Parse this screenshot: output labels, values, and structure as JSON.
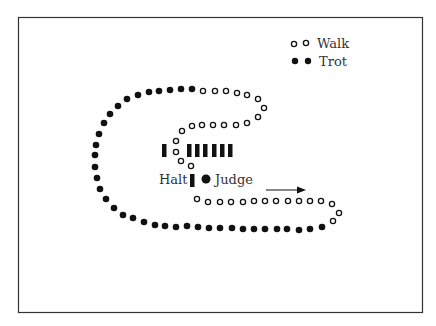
{
  "legend": {
    "walk_label": "Walk",
    "trot_label": "Trot"
  },
  "labels": {
    "halt": "Halt",
    "judge": "Judge"
  },
  "colors": {
    "ink": "#111111",
    "frame": "#333333",
    "background": "#ffffff"
  },
  "diagram": {
    "trot_dots": [
      [
        138,
        95
      ],
      [
        149,
        92
      ],
      [
        159,
        91
      ],
      [
        170,
        90
      ],
      [
        181,
        89
      ],
      [
        192,
        89
      ],
      [
        127,
        99
      ],
      [
        118,
        106
      ],
      [
        110,
        114
      ],
      [
        104,
        123
      ],
      [
        99,
        134
      ],
      [
        96,
        145
      ],
      [
        95,
        155
      ],
      [
        95,
        167
      ],
      [
        97,
        178
      ],
      [
        100,
        189
      ],
      [
        106,
        199
      ],
      [
        114,
        208
      ],
      [
        123,
        215
      ],
      [
        133,
        218
      ],
      [
        144,
        222
      ],
      [
        155,
        225
      ],
      [
        165,
        226
      ],
      [
        176,
        227
      ],
      [
        187,
        226
      ],
      [
        198,
        227
      ],
      [
        209,
        228
      ],
      [
        220,
        228
      ],
      [
        232,
        228
      ],
      [
        243,
        229
      ],
      [
        254,
        229
      ],
      [
        265,
        229
      ],
      [
        277,
        229
      ],
      [
        287,
        229
      ],
      [
        299,
        230
      ],
      [
        310,
        229
      ],
      [
        322,
        227
      ]
    ],
    "walk_dots": [
      [
        203,
        91
      ],
      [
        215,
        91
      ],
      [
        226,
        91
      ],
      [
        237,
        93
      ],
      [
        247,
        95
      ],
      [
        258,
        99
      ],
      [
        264,
        108
      ],
      [
        258,
        117
      ],
      [
        247,
        123
      ],
      [
        236,
        125
      ],
      [
        224,
        125
      ],
      [
        213,
        125
      ],
      [
        202,
        125
      ],
      [
        192,
        126
      ],
      [
        182,
        131
      ],
      [
        176,
        141
      ],
      [
        176,
        152
      ],
      [
        181,
        161
      ],
      [
        191,
        166
      ],
      [
        197,
        199
      ],
      [
        208,
        202
      ],
      [
        220,
        202
      ],
      [
        231,
        202
      ],
      [
        243,
        202
      ],
      [
        254,
        201
      ],
      [
        265,
        201
      ],
      [
        276,
        201
      ],
      [
        288,
        201
      ],
      [
        299,
        201
      ],
      [
        310,
        201
      ],
      [
        321,
        201
      ],
      [
        332,
        204
      ],
      [
        339,
        213
      ],
      [
        333,
        221
      ]
    ],
    "bars_x": [
      162,
      187,
      195,
      203,
      212,
      220,
      228
    ],
    "halt_bar": [
      190,
      174
    ],
    "judge_dot": [
      206,
      179
    ],
    "arrow": {
      "x1": 266,
      "y1": 190,
      "x2": 305,
      "y2": 190
    }
  }
}
